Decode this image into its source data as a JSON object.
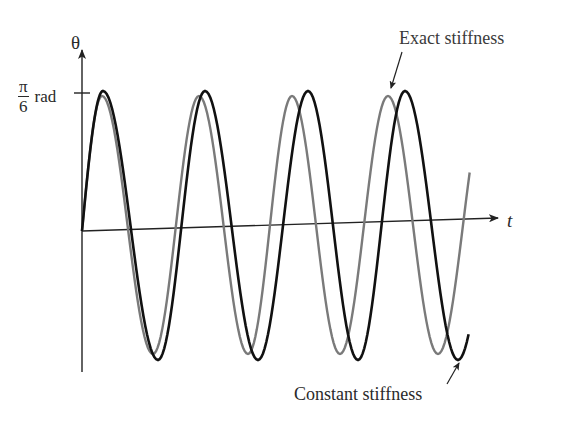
{
  "chart_data": {
    "type": "line",
    "title": "",
    "xlabel": "t",
    "ylabel": "θ",
    "y_tick": {
      "numerator": "π",
      "denominator": "6",
      "unit": "rad",
      "value": 0.5236
    },
    "grid": false,
    "legend_position": "annotations",
    "ylim": [
      -0.6,
      0.65
    ],
    "series": [
      {
        "name": "Exact stiffness",
        "color": "#7a7a7a",
        "description": "Gray curve with slightly smaller amplitude and shorter period (~0.94x)",
        "amplitude_rad": 0.5,
        "relative_period": 0.94,
        "peaks_x_px": [
          102,
          199,
          292,
          388
        ],
        "troughs_x_px": [
          153,
          248,
          340,
          438
        ]
      },
      {
        "name": "Constant stiffness",
        "color": "#111111",
        "description": "Black curve with amplitude π/6 and period 1.0 (reference)",
        "amplitude_rad": 0.5236,
        "relative_period": 1.0,
        "peaks_x_px": [
          103,
          205,
          308,
          405
        ],
        "troughs_x_px": [
          158,
          258,
          358,
          458
        ]
      }
    ],
    "annotations": [
      {
        "text": "Exact stiffness",
        "points_to": "gray curve peak near x=388"
      },
      {
        "text": "Constant stiffness",
        "points_to": "black curve trough near x=458"
      }
    ]
  },
  "labels": {
    "y_axis": "θ",
    "x_axis": "t",
    "tick_num": "π",
    "tick_den": "6",
    "tick_unit": "rad",
    "legend_exact": "Exact stiffness",
    "legend_constant": "Constant stiffness"
  },
  "colors": {
    "axis": "#222222",
    "exact": "#7a7a7a",
    "constant": "#111111"
  }
}
